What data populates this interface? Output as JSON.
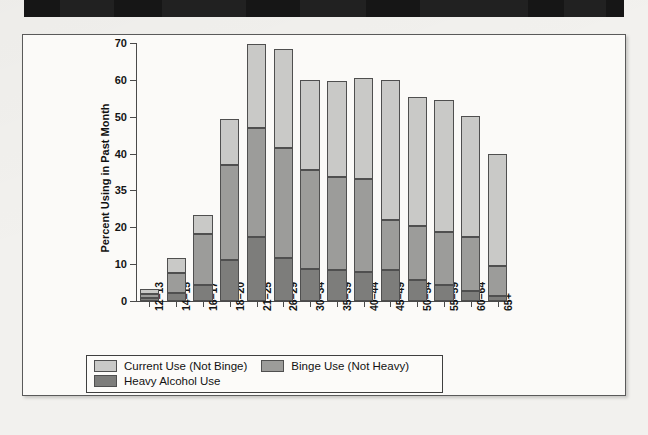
{
  "chart_data": {
    "type": "bar",
    "subtype": "stacked-bar",
    "title": "",
    "xlabel": "Age in Years",
    "ylabel": "Percent Using in Past Month",
    "ylim": [
      0,
      70
    ],
    "ytick_labels": [
      "0",
      "10",
      "20",
      "35",
      "40",
      "50",
      "60",
      "70"
    ],
    "ytick_values": [
      0,
      10,
      20,
      30,
      40,
      50,
      60,
      70
    ],
    "grid": false,
    "legend_position": "bottom",
    "categories": [
      "12–13",
      "14–15",
      "16–17",
      "18–20",
      "21–25",
      "26–29",
      "30–34",
      "35–39",
      "40–44",
      "45–49",
      "50–54",
      "55–59",
      "60–64",
      "65+"
    ],
    "series": [
      {
        "name": "Heavy Alcohol Use",
        "color": "#7d7d7b",
        "values": [
          0.9,
          2.1,
          4.4,
          11.0,
          17.5,
          11.8,
          8.8,
          8.4,
          8.0,
          8.4,
          5.8,
          4.3,
          2.8,
          1.3
        ]
      },
      {
        "name": "Binge Use (Not Heavy)",
        "color": "#9c9c9a",
        "values": [
          1.0,
          5.4,
          13.9,
          26.0,
          29.5,
          29.6,
          26.7,
          25.3,
          25.0,
          13.7,
          14.5,
          14.4,
          14.5,
          8.1
        ]
      },
      {
        "name": "Current Use (Not Binge)",
        "color": "#c9c9c7",
        "values": [
          1.4,
          4.3,
          5.0,
          12.5,
          22.8,
          27.0,
          24.6,
          26.0,
          27.4,
          37.8,
          35.1,
          35.8,
          33.0,
          30.6
        ]
      }
    ],
    "stack_totals": [
      3.3,
      11.8,
      23.3,
      49.5,
      69.8,
      68.4,
      60.1,
      59.7,
      60.4,
      59.9,
      55.4,
      54.5,
      50.3,
      40.0
    ]
  },
  "legend": {
    "items": [
      {
        "label": "Current Use (Not Binge)",
        "color": "#c9c9c7"
      },
      {
        "label": "Binge Use (Not Heavy)",
        "color": "#9c9c9a"
      },
      {
        "label": "Heavy Alcohol Use",
        "color": "#7d7d7b"
      }
    ]
  },
  "axis_titles": {
    "x": "Age in Years",
    "y": "Percent Using in Past Month"
  }
}
